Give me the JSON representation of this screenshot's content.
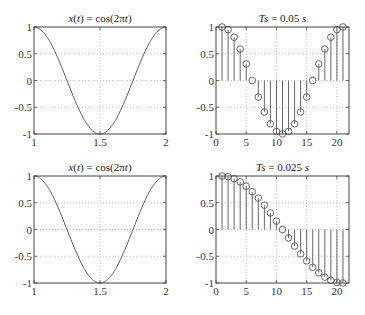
{
  "chart_data": [
    {
      "type": "line",
      "title": "x(t) = cos(2πt)",
      "xlabel": "",
      "ylabel": "",
      "xlim": [
        1,
        2
      ],
      "ylim": [
        -1,
        1
      ],
      "xticks": [
        "1",
        "1.5",
        "2"
      ],
      "yticks": [
        "-1",
        "-0.5",
        "0",
        "0.5",
        "1"
      ],
      "grid": true,
      "function": "cos(2*pi*t)",
      "x": [
        1.0,
        1.1,
        1.2,
        1.3,
        1.4,
        1.5,
        1.6,
        1.7,
        1.8,
        1.9,
        2.0
      ],
      "values": [
        1.0,
        0.809,
        0.309,
        -0.309,
        -0.809,
        -1.0,
        -0.809,
        -0.309,
        0.309,
        0.809,
        1.0
      ]
    },
    {
      "type": "stem",
      "title": "Ts = 0.05 s",
      "title_italic_part": "Ts",
      "title_rest": " = 0.05 s",
      "xlim": [
        0,
        22
      ],
      "ylim": [
        -1,
        1
      ],
      "xticks": [
        "0",
        "5",
        "10",
        "15",
        "20"
      ],
      "yticks": [
        "-1",
        "-0.5",
        "0",
        "0.5",
        "1"
      ],
      "grid": true,
      "x": [
        1,
        2,
        3,
        4,
        5,
        6,
        7,
        8,
        9,
        10,
        11,
        12,
        13,
        14,
        15,
        16,
        17,
        18,
        19,
        20,
        21
      ],
      "values": [
        1.0,
        0.951,
        0.809,
        0.588,
        0.309,
        0.0,
        -0.309,
        -0.588,
        -0.809,
        -0.951,
        -1.0,
        -0.951,
        -0.809,
        -0.588,
        -0.309,
        0.0,
        0.309,
        0.588,
        0.809,
        0.951,
        1.0
      ]
    },
    {
      "type": "line",
      "title": "x(t) = cos(2πt)",
      "xlim": [
        1,
        2
      ],
      "ylim": [
        -1,
        1
      ],
      "xticks": [
        "1",
        "1.5",
        "2"
      ],
      "yticks": [
        "-1",
        "-0.5",
        "0",
        "0.5",
        "1"
      ],
      "grid": true,
      "function": "cos(2*pi*t)",
      "x": [
        1.0,
        1.1,
        1.2,
        1.3,
        1.4,
        1.5,
        1.6,
        1.7,
        1.8,
        1.9,
        2.0
      ],
      "values": [
        1.0,
        0.809,
        0.309,
        -0.309,
        -0.809,
        -1.0,
        -0.809,
        -0.309,
        0.309,
        0.809,
        1.0
      ]
    },
    {
      "type": "stem",
      "title": "Ts = 0.025 s",
      "title_italic_part": "Ts",
      "title_rest": " = 0.025 s",
      "xlim": [
        0,
        22
      ],
      "ylim": [
        -1,
        1
      ],
      "xticks": [
        "0",
        "5",
        "10",
        "15",
        "20"
      ],
      "yticks": [
        "-1",
        "-0.5",
        "0",
        "0.5",
        "1"
      ],
      "grid": true,
      "x": [
        1,
        2,
        3,
        4,
        5,
        6,
        7,
        8,
        9,
        10,
        11,
        12,
        13,
        14,
        15,
        16,
        17,
        18,
        19,
        20,
        21
      ],
      "values": [
        1.0,
        0.988,
        0.951,
        0.891,
        0.809,
        0.707,
        0.588,
        0.454,
        0.309,
        0.156,
        0.0,
        -0.156,
        -0.309,
        -0.454,
        -0.588,
        -0.707,
        -0.809,
        -0.891,
        -0.951,
        -0.988,
        -1.0
      ]
    }
  ]
}
